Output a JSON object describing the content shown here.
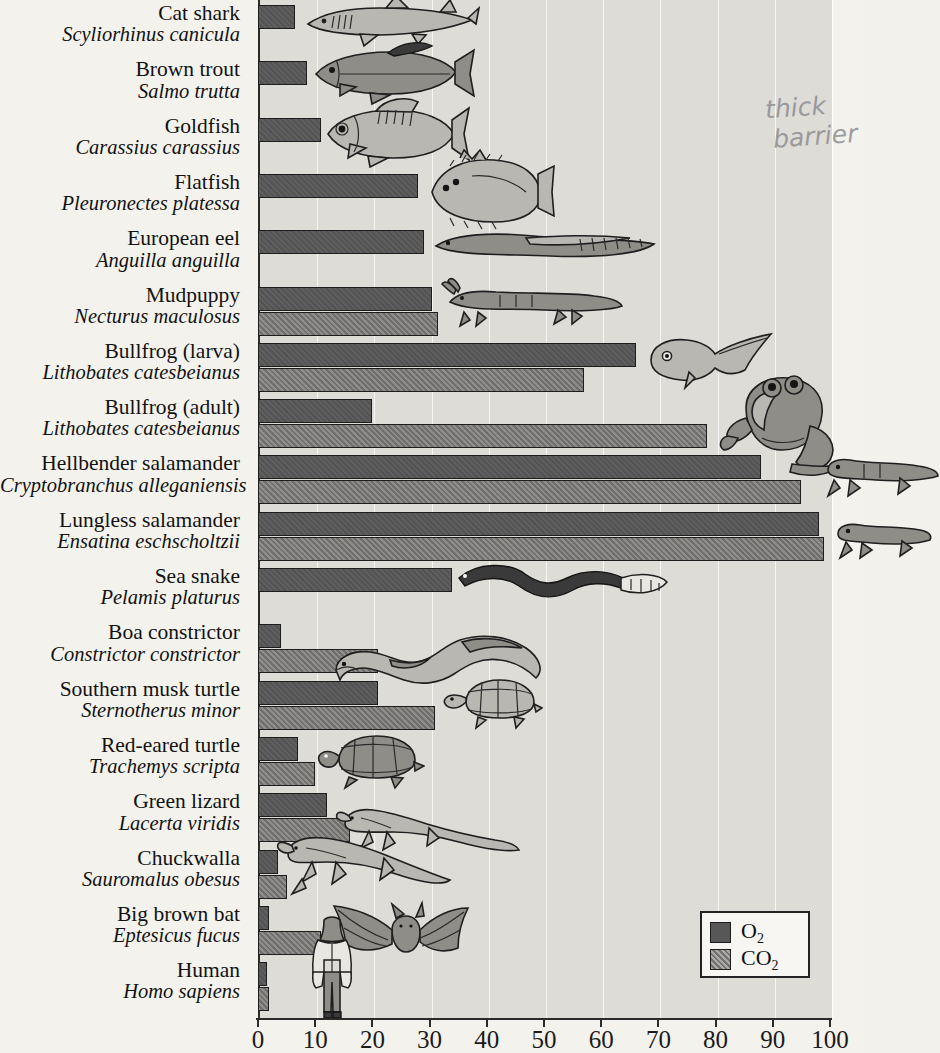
{
  "figure": {
    "annotation_line1": "thick",
    "annotation_line2": "barrier"
  },
  "legend": {
    "position": "bottom-right",
    "items": [
      {
        "key": "o2",
        "label": "O₂",
        "color": "#575757"
      },
      {
        "key": "co2",
        "label": "CO₂",
        "color": "#8d8b88"
      }
    ]
  },
  "axis": {
    "ticks": [
      "0",
      "10",
      "20",
      "30",
      "40",
      "50",
      "60",
      "70",
      "80",
      "90",
      "100"
    ],
    "min": 0,
    "max": 100
  },
  "chart_data": {
    "type": "bar",
    "orientation": "horizontal",
    "title": "",
    "xlabel": "",
    "ylabel": "",
    "xlim": [
      0,
      100
    ],
    "grid": true,
    "legend_position": "bottom-right",
    "categories": [
      "Cat shark",
      "Brown trout",
      "Goldfish",
      "Flatfish",
      "European eel",
      "Mudpuppy",
      "Bullfrog (larva)",
      "Bullfrog (adult)",
      "Hellbender salamander",
      "Lungless salamander",
      "Sea snake",
      "Boa constrictor",
      "Southern musk turtle",
      "Red-eared turtle",
      "Green lizard",
      "Chuckwalla",
      "Big brown bat",
      "Human"
    ],
    "series": [
      {
        "name": "O₂",
        "values": [
          6.5,
          8.5,
          11,
          28,
          29,
          30.5,
          66,
          20,
          88,
          98,
          34,
          4,
          21,
          7,
          12,
          3.5,
          2,
          1.5
        ]
      },
      {
        "name": "CO₂",
        "values": [
          0,
          0,
          0,
          0,
          0,
          31.5,
          57,
          78.5,
          95,
          99,
          0,
          21,
          31,
          10,
          16,
          5,
          11,
          2
        ]
      }
    ]
  },
  "species": [
    {
      "common": "Cat shark",
      "sci": "Scyliorhinus canicula",
      "o2": 6.5,
      "co2": 0,
      "art": "shark"
    },
    {
      "common": "Brown trout",
      "sci": "Salmo trutta",
      "o2": 8.5,
      "co2": 0,
      "art": "trout"
    },
    {
      "common": "Goldfish",
      "sci": "Carassius carassius",
      "o2": 11,
      "co2": 0,
      "art": "goldfish"
    },
    {
      "common": "Flatfish",
      "sci": "Pleuronectes platessa",
      "o2": 28,
      "co2": 0,
      "art": "flatfish"
    },
    {
      "common": "European eel",
      "sci": "Anguilla anguilla",
      "o2": 29,
      "co2": 0,
      "art": "eel"
    },
    {
      "common": "Mudpuppy",
      "sci": "Necturus maculosus",
      "o2": 30.5,
      "co2": 31.5,
      "art": "mudpuppy"
    },
    {
      "common": "Bullfrog (larva)",
      "sci": "Lithobates catesbeianus",
      "o2": 66,
      "co2": 57,
      "art": "tadpole"
    },
    {
      "common": "Bullfrog (adult)",
      "sci": "Lithobates catesbeianus",
      "o2": 20,
      "co2": 78.5,
      "art": "frog"
    },
    {
      "common": "Hellbender salamander",
      "sci": "Cryptobranchus alleganiensis",
      "o2": 88,
      "co2": 95,
      "art": "hellbender"
    },
    {
      "common": "Lungless salamander",
      "sci": "Ensatina eschscholtzii",
      "o2": 98,
      "co2": 99,
      "art": "ensatina"
    },
    {
      "common": "Sea snake",
      "sci": "Pelamis platurus",
      "o2": 34,
      "co2": 0,
      "art": "seasnake"
    },
    {
      "common": "Boa constrictor",
      "sci": "Constrictor constrictor",
      "o2": 4,
      "co2": 21,
      "art": "boa"
    },
    {
      "common": "Southern musk turtle",
      "sci": "Sternotherus minor",
      "o2": 21,
      "co2": 31,
      "art": "muskturtle"
    },
    {
      "common": "Red-eared turtle",
      "sci": "Trachemys scripta",
      "o2": 7,
      "co2": 10,
      "art": "redturtle"
    },
    {
      "common": "Green lizard",
      "sci": "Lacerta viridis",
      "o2": 12,
      "co2": 16,
      "art": "lizard"
    },
    {
      "common": "Chuckwalla",
      "sci": "Sauromalus obesus",
      "o2": 3.5,
      "co2": 5,
      "art": "chuckwalla"
    },
    {
      "common": "Big brown bat",
      "sci": "Eptesicus fucus",
      "o2": 2,
      "co2": 11,
      "art": "bat"
    },
    {
      "common": "Human",
      "sci": "Homo sapiens",
      "o2": 1.5,
      "co2": 2,
      "art": "human"
    }
  ]
}
